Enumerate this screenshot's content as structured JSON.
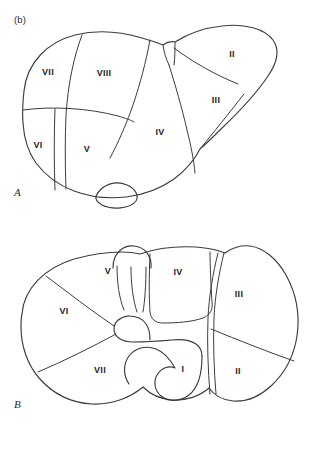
{
  "figure": {
    "caption_label": "(b)",
    "line_color": "#3c3c3c",
    "label_color": "#1f1f1f",
    "background_color": "#ffffff"
  },
  "panels": [
    {
      "letter": "A",
      "view": "anterior",
      "segments": [
        {
          "id": "VII",
          "label": "VII",
          "x": 48,
          "y": 55
        },
        {
          "id": "VIII",
          "label": "VIII",
          "x": 104,
          "y": 56
        },
        {
          "id": "II",
          "label": "II",
          "x": 232,
          "y": 37
        },
        {
          "id": "III",
          "label": "III",
          "x": 216,
          "y": 83
        },
        {
          "id": "VI",
          "label": "VI",
          "x": 38,
          "y": 128
        },
        {
          "id": "V",
          "label": "V",
          "x": 87,
          "y": 132
        },
        {
          "id": "IV",
          "label": "IV",
          "x": 160,
          "y": 115
        }
      ]
    },
    {
      "letter": "B",
      "view": "inferior-visceral",
      "segments": [
        {
          "id": "V",
          "label": "V",
          "x": 108,
          "y": 44
        },
        {
          "id": "IV",
          "label": "IV",
          "x": 178,
          "y": 45
        },
        {
          "id": "III",
          "label": "III",
          "x": 239,
          "y": 67
        },
        {
          "id": "VI",
          "label": "VI",
          "x": 64,
          "y": 84
        },
        {
          "id": "VII",
          "label": "VII",
          "x": 100,
          "y": 143
        },
        {
          "id": "I",
          "label": "I",
          "x": 183,
          "y": 142
        },
        {
          "id": "II",
          "label": "II",
          "x": 238,
          "y": 144
        }
      ]
    }
  ]
}
